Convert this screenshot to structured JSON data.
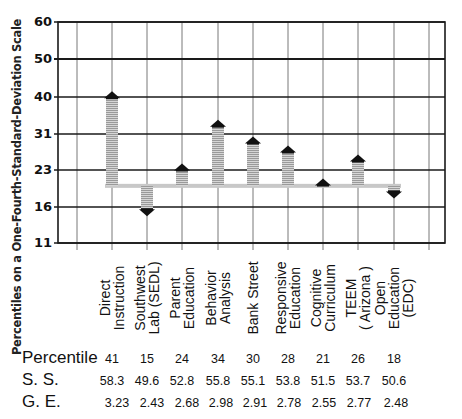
{
  "chart_data": {
    "type": "bar",
    "subtype": "arrow-deviation-from-baseline",
    "title": "",
    "ylabel": "Percentiles on a One-Fourth-Standard-Deviation Scale",
    "xlabel": "",
    "y_ticks": [
      60,
      50,
      40,
      31,
      23,
      16,
      11
    ],
    "ylim": [
      11,
      60
    ],
    "baseline_percentile": 20,
    "grid": true,
    "categories": [
      "Direct\nInstruction",
      "Southwest\nLab (SEDL)",
      "Parent\nEducation",
      "Behavior\nAnalysis",
      "Bank Street",
      "Responsive\nEducation",
      "Cognitive\nCurriculum",
      "TEEM\n( Arizona )",
      "Open\nEducation\n(EDC)"
    ],
    "series": [
      {
        "name": "Percentile",
        "values": [
          41,
          15,
          24,
          34,
          30,
          28,
          21,
          26,
          18
        ]
      },
      {
        "name": "S. S.",
        "values": [
          58.3,
          49.6,
          52.8,
          55.8,
          55.1,
          53.8,
          51.5,
          53.7,
          50.6
        ]
      },
      {
        "name": "G. E.",
        "values": [
          3.23,
          2.43,
          2.68,
          2.98,
          2.91,
          2.78,
          2.55,
          2.77,
          2.48
        ]
      }
    ]
  },
  "axis": {
    "ylabel": "Percentiles on a One-Fourth-Standard-Deviation Scale",
    "ticks": [
      "60",
      "50",
      "40",
      "31",
      "23",
      "16",
      "11"
    ]
  },
  "categories": [
    "Direct\nInstruction",
    "Southwest\nLab (SEDL)",
    "Parent\nEducation",
    "Behavior\nAnalysis",
    "Bank Street",
    "Responsive\nEducation",
    "Cognitive\nCurriculum",
    "TEEM\n( Arizona )",
    "Open\nEducation\n(EDC)"
  ],
  "table": {
    "rows": [
      {
        "label": "Percentile",
        "values": [
          "41",
          "15",
          "24",
          "34",
          "30",
          "28",
          "21",
          "26",
          "18"
        ]
      },
      {
        "label": "S. S.",
        "values": [
          "58.3",
          "49.6",
          "52.8",
          "55.8",
          "55.1",
          "53.8",
          "51.5",
          "53.7",
          "50.6"
        ]
      },
      {
        "label": "G. E.",
        "values": [
          "3.23",
          "2.43",
          "2.68",
          "2.98",
          "2.91",
          "2.78",
          "2.55",
          "2.77",
          "2.48"
        ]
      }
    ]
  },
  "colors": {
    "grid": "#1a1a1a",
    "arrow_head": "#111111",
    "arrow_shaft": "#b8b8b8",
    "baseline": "#c8c8c8"
  }
}
